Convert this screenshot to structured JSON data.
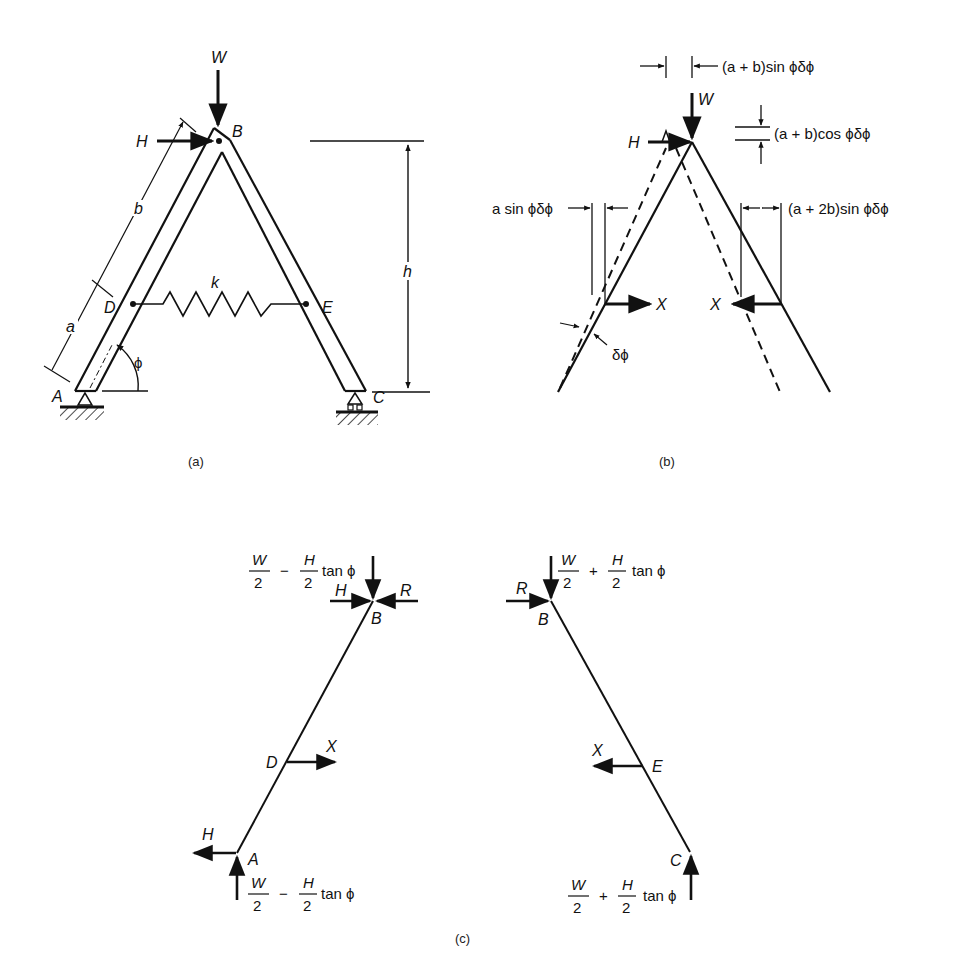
{
  "figure": {
    "panels": [
      {
        "id": "a",
        "caption": "(a)",
        "description": "Two-bar A-frame with pin support at A, roller at C, spring k between D and E",
        "labels": {
          "load_vertical": "W",
          "load_horizontal": "H",
          "joint_top": "B",
          "support_left": "A",
          "support_right": "C",
          "spring_left": "D",
          "spring_right": "E",
          "spring": "k",
          "length_lower": "a",
          "length_upper": "b",
          "height": "h",
          "angle": "ϕ"
        }
      },
      {
        "id": "b",
        "caption": "(b)",
        "description": "Virtual displacement diagram (dashed = displaced position)",
        "labels": {
          "load_vertical": "W",
          "load_horizontal": "H",
          "spring_force_left": "X",
          "spring_force_right": "X",
          "rotation": "δϕ",
          "disp_top_horizontal": "(a + b)sin ϕδϕ",
          "disp_top_vertical": "(a + b)cos ϕδϕ",
          "disp_D": "a sin ϕδϕ",
          "disp_E": "(a + 2b)sin ϕδϕ"
        }
      },
      {
        "id": "c",
        "caption": "(c)",
        "description": "Free-body diagrams of bars AB and BC",
        "left_bar": {
          "top_joint": "B",
          "middle_point": "D",
          "bottom_joint": "A",
          "force_H_top": "H",
          "force_R": "R",
          "force_X": "X",
          "force_H_bottom": "H",
          "top_vertical": {
            "num1": "W",
            "den1": "2",
            "op": "−",
            "num2": "H",
            "den2": "2",
            "tail": "tan ϕ"
          },
          "bottom_vertical": {
            "num1": "W",
            "den1": "2",
            "op": "−",
            "num2": "H",
            "den2": "2",
            "tail": "tan ϕ"
          }
        },
        "right_bar": {
          "top_joint": "B",
          "middle_point": "E",
          "bottom_joint": "C",
          "force_R": "R",
          "force_X": "X",
          "top_vertical": {
            "num1": "W",
            "den1": "2",
            "op": "+",
            "num2": "H",
            "den2": "2",
            "tail": "tan ϕ"
          },
          "bottom_vertical": {
            "num1": "W",
            "den1": "2",
            "op": "+",
            "num2": "H",
            "den2": "2",
            "tail": "tan ϕ"
          }
        }
      }
    ],
    "colors": {
      "ink": "#111111",
      "background": "#ffffff"
    }
  }
}
